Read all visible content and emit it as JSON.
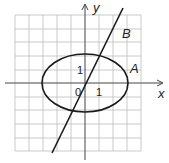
{
  "diagram": {
    "axes": {
      "x_label": "x",
      "y_label": "y",
      "origin_label": "0",
      "x_tick_label": "1",
      "y_tick_label": "1"
    },
    "curves": [
      {
        "name": "A",
        "label": "A",
        "type": "ellipse",
        "center": [
          0,
          0
        ],
        "semi_axis_x": 3,
        "semi_axis_y": 2
      },
      {
        "name": "B",
        "label": "B",
        "type": "line",
        "slope": 2,
        "intercept": 0
      }
    ],
    "grid": {
      "x_range": [
        -5,
        4
      ],
      "y_range": [
        -5,
        5
      ]
    },
    "colors": {
      "grid": "#b8b8b8",
      "curve": "#1a1a1a",
      "axis": "#333333"
    }
  }
}
